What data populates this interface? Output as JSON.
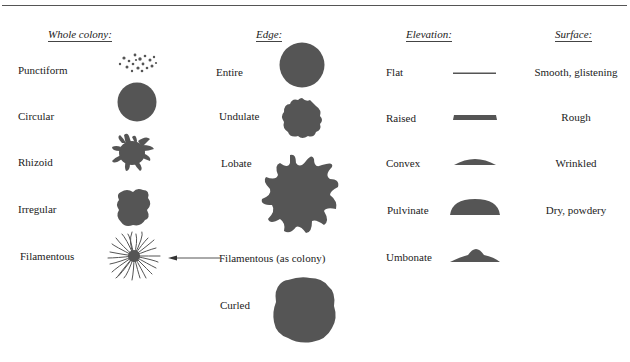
{
  "headers": {
    "whole_colony": "Whole colony:",
    "edge": "Edge:",
    "elevation": "Elevation:",
    "surface": "Surface:"
  },
  "whole_colony": {
    "items": [
      {
        "label": "Punctiform",
        "icon": "punctiform-icon"
      },
      {
        "label": "Circular",
        "icon": "circular-icon"
      },
      {
        "label": "Rhizoid",
        "icon": "rhizoid-icon"
      },
      {
        "label": "Irregular",
        "icon": "irregular-icon"
      },
      {
        "label": "Filamentous",
        "icon": "filamentous-icon"
      }
    ]
  },
  "edge": {
    "items": [
      {
        "label": "Entire",
        "icon": "entire-edge-icon"
      },
      {
        "label": "Undulate",
        "icon": "undulate-edge-icon"
      },
      {
        "label": "Lobate",
        "icon": "lobate-edge-icon"
      },
      {
        "label": "Filamentous (as colony)",
        "icon": "arrow-left-icon"
      },
      {
        "label": "Curled",
        "icon": "curled-edge-icon"
      }
    ]
  },
  "elevation": {
    "items": [
      {
        "label": "Flat",
        "icon": "flat-elevation-icon"
      },
      {
        "label": "Raised",
        "icon": "raised-elevation-icon"
      },
      {
        "label": "Convex",
        "icon": "convex-elevation-icon"
      },
      {
        "label": "Pulvinate",
        "icon": "pulvinate-elevation-icon"
      },
      {
        "label": "Umbonate",
        "icon": "umbonate-elevation-icon"
      }
    ]
  },
  "surface": {
    "items": [
      {
        "label": "Smooth, glistening"
      },
      {
        "label": "Rough"
      },
      {
        "label": "Wrinkled"
      },
      {
        "label": "Dry, powdery"
      }
    ]
  },
  "colors": {
    "shape_fill": "#555555",
    "text": "#222222",
    "rule": "#555555"
  }
}
